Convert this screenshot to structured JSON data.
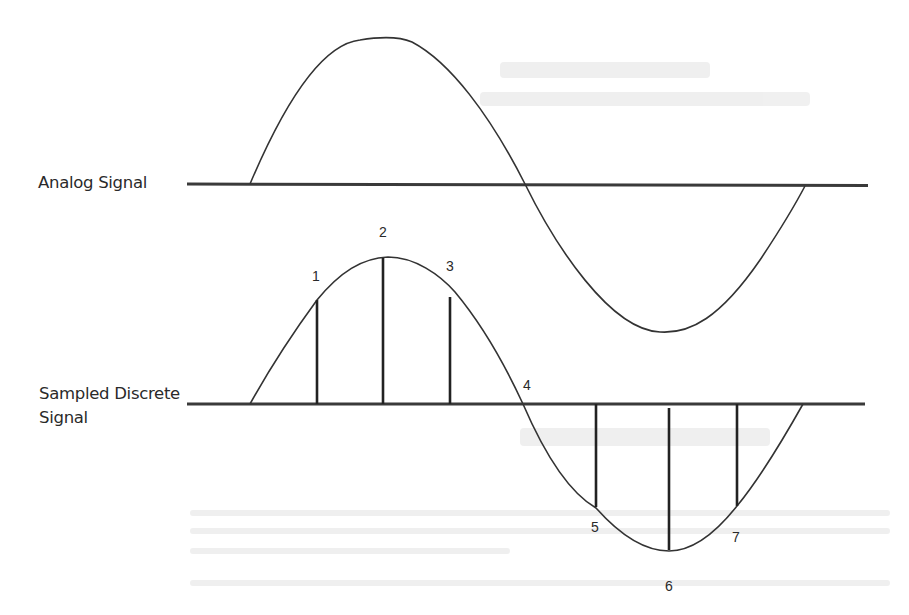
{
  "diagram": {
    "labels": {
      "analog": "Analog Signal",
      "sampled_line1": "Sampled Discrete",
      "sampled_line2": "Signal"
    },
    "samples": [
      {
        "id": "1",
        "label": "1"
      },
      {
        "id": "2",
        "label": "2"
      },
      {
        "id": "3",
        "label": "3"
      },
      {
        "id": "4",
        "label": "4"
      },
      {
        "id": "5",
        "label": "5"
      },
      {
        "id": "6",
        "label": "6"
      },
      {
        "id": "7",
        "label": "7"
      }
    ],
    "colors": {
      "stroke": "#333333",
      "axis": "#3a3a3a",
      "text": "#2a2a2a",
      "background": "#ffffff"
    }
  }
}
